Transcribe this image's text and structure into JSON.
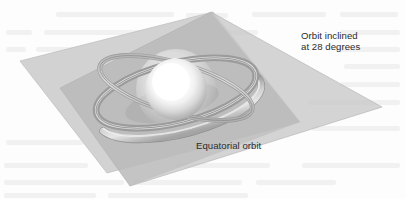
{
  "figure": {
    "name": "orbital-inclination-diagram",
    "type": "3d-technical-illustration",
    "background_color": "#ffffff",
    "width": 406,
    "height": 199
  },
  "labels": {
    "inclined": {
      "line1": "Orbit inclined",
      "line2": "at 28 degrees",
      "full": "Orbit inclined at 28 degrees",
      "color": "#2b2b2b"
    },
    "equatorial": {
      "line1": "Equatorial orbit",
      "full": "Equatorial orbit",
      "color": "#2b2b2b"
    }
  },
  "scene": {
    "central_body": {
      "name": "earth-sphere",
      "description": "glowing white sphere",
      "core_color": "#ffffff",
      "mid_color": "#e8e8e8",
      "edge_color": "#b5b5b5",
      "center_x": 176,
      "center_y": 89,
      "radius": 31
    },
    "equatorial_plane": {
      "name": "equatorial-plane",
      "fill_color": "#d2d2d2",
      "edge_color": "#b9b9b9",
      "points": "20,61 213,12 300,122 107,173"
    },
    "inclined_plane": {
      "name": "inclined-plane",
      "fill_color": "#cfcfcf",
      "edge_color": "#bcbcbc",
      "points": "211,12 382,107 130,186 60,88"
    },
    "plane_overlap_color": "#a9a9a9",
    "equatorial_orbit_ring": {
      "name": "equatorial-orbit-ring",
      "band_color": "#bdbdbd",
      "highlight_color": "#e2e2e2",
      "shadow_color": "#8e8e8e",
      "center_x": 176,
      "center_y": 93,
      "rx": 82,
      "ry": 30,
      "rotation_deg": -15,
      "band_width": 7
    },
    "inclined_orbit_ring": {
      "name": "inclined-orbit-ring",
      "band_color": "#c6c6c6",
      "highlight_color": "#e4e4e4",
      "shadow_color": "#949494",
      "center_x": 176,
      "center_y": 88,
      "rx": 79,
      "ry": 26,
      "rotation_deg": 14,
      "band_width": 5
    },
    "inclination_degrees": 28
  }
}
